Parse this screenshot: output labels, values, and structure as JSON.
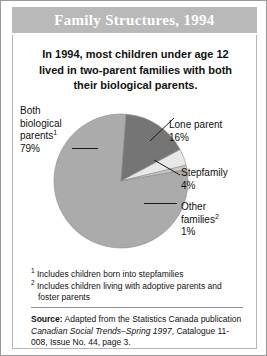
{
  "header": {
    "title": "Family Structures, 1994"
  },
  "headline": "In 1994, most children under age 12 lived in two-parent families with both their biological parents.",
  "labels": {
    "both_name_line1": "Both",
    "both_name_line2": "biological",
    "both_name_line3": "parents",
    "both_footnote_marker": "1",
    "both_value": "79%",
    "lone_name": "Lone parent",
    "lone_value": "16%",
    "step_name": "Stepfamily",
    "step_value": "4%",
    "other_name_line1": "Other",
    "other_name_line2": "families",
    "other_footnote_marker": "2",
    "other_value": "1%"
  },
  "footnotes": [
    {
      "marker": "1",
      "text": "Includes children born into stepfamilies"
    },
    {
      "marker": "2",
      "text": "Includes children living with adoptive parents and foster parents"
    }
  ],
  "source": {
    "label": "Source:",
    "text_part1": "Adapted from the Statistics Canada publication",
    "publication": "Canadian Social Trends–Spring 1997",
    "text_part2": ", Catalogue 11-008, Issue No. 44, page 3."
  },
  "colors": {
    "header_band": "#b9b9b9",
    "slice_both": "#ababab",
    "slice_lone": "#757575",
    "slice_step": "#e8e8e8",
    "slice_other": "#c9c9c9",
    "outline": "#8a8a8a",
    "leader": "#1a1a1a"
  },
  "chart_data": {
    "type": "pie",
    "title": "Family Structures, 1994",
    "categories": [
      "Both biological parents",
      "Lone parent",
      "Stepfamily",
      "Other families"
    ],
    "values": [
      79,
      16,
      4,
      1
    ],
    "unit": "%",
    "labels": [
      "79%",
      "16%",
      "4%",
      "1%"
    ],
    "colors": [
      "#ababab",
      "#757575",
      "#e8e8e8",
      "#c9c9c9"
    ],
    "legend": "leader-line callouts",
    "start_angle_deg": -10,
    "direction": "clockwise",
    "footnote_markers": {
      "Both biological parents": "1",
      "Other families": "2"
    }
  }
}
